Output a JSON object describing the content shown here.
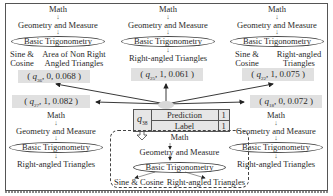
{
  "diagram": {
    "center": {
      "question": "q",
      "question_sub": "38",
      "rows": [
        {
          "label": "Prediction",
          "value": "1"
        },
        {
          "label": "Label",
          "value": "1"
        }
      ],
      "tree": {
        "level1": "Math",
        "level2": "Geometry and Measure",
        "level3": "Basic Trigonometry",
        "children": [
          "Sine & Cosine",
          "Right-angled Triangles"
        ]
      }
    },
    "neighbors": [
      {
        "id": "top-left",
        "tuple": {
          "q": "q",
          "sub": "36",
          "label": "0",
          "weight": "0.068"
        },
        "tree": {
          "level1": "Math",
          "level2": "Geometry and Measure",
          "level3": "Basic Trigonometry",
          "children": [
            "Sine & Cosine",
            "Area of Non Right Angled Triangles"
          ]
        }
      },
      {
        "id": "top-middle",
        "tuple": {
          "q": "q",
          "sub": "25",
          "label": "1",
          "weight": "0.061"
        },
        "tree": {
          "level1": "Math",
          "level2": "Geometry and Measure",
          "level3": "Basic Trigonometry",
          "children": [
            "Right-angled Triangles"
          ]
        }
      },
      {
        "id": "top-right",
        "tuple": {
          "q": "q",
          "sub": "22",
          "label": "1",
          "weight": "0.075"
        },
        "tree": {
          "level1": "Math",
          "level2": "Geometry and Measure",
          "level3": "Basic Trigonometry",
          "children": [
            "Sine & Cosine",
            "Right-angled Triangles"
          ]
        }
      },
      {
        "id": "bottom-left",
        "tuple": {
          "q": "q",
          "sub": "27",
          "label": "1",
          "weight": "0.082"
        },
        "tree": {
          "level1": "Math",
          "level2": "Geometry and Measure",
          "level3": "Basic Trigonometry",
          "children": [
            "Right-angled Triangles"
          ]
        }
      },
      {
        "id": "bottom-right",
        "tuple": {
          "q": "q",
          "sub": "18",
          "label": "0",
          "weight": "0.072"
        },
        "tree": {
          "level1": "Math",
          "level2": "Geometry and Measure",
          "level3": "Basic Trigonometry",
          "children": [
            "Right-angled Triangles"
          ]
        }
      }
    ],
    "symbols": {
      "down_arrow": "↓",
      "comma": ", ",
      "open": "( ",
      "close": " )"
    }
  }
}
